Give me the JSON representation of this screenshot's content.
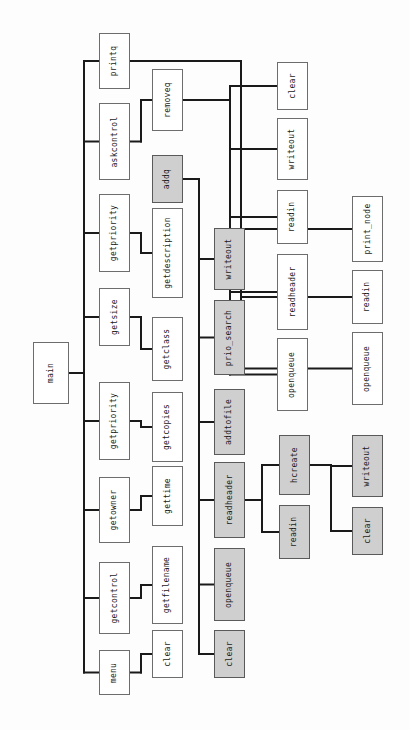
{
  "diagram": {
    "orientation": "rotated-90",
    "colors": {
      "node_fill": "#ffffff",
      "node_fill_highlight": "#cfcfcf",
      "node_border": "#6d6d6d",
      "edge": "#1a1a1a",
      "background": "#fdfdfd"
    },
    "nodes": [
      {
        "id": "main",
        "label": "main",
        "highlight": false,
        "x": 33,
        "y": 342,
        "w": 36,
        "h": 62
      },
      {
        "id": "printq",
        "label": "printq",
        "highlight": false,
        "x": 99,
        "y": 33,
        "w": 31,
        "h": 56
      },
      {
        "id": "askcontrol",
        "label": "askcontrol",
        "highlight": false,
        "x": 99,
        "y": 103,
        "w": 31,
        "h": 77
      },
      {
        "id": "getpriority1",
        "label": "getpriority",
        "highlight": false,
        "x": 99,
        "y": 194,
        "w": 31,
        "h": 78
      },
      {
        "id": "getsize",
        "label": "getsize",
        "highlight": false,
        "x": 99,
        "y": 288,
        "w": 31,
        "h": 58
      },
      {
        "id": "getpriority2",
        "label": "getpriority",
        "highlight": false,
        "x": 99,
        "y": 382,
        "w": 31,
        "h": 78
      },
      {
        "id": "getowner",
        "label": "getowner",
        "highlight": false,
        "x": 99,
        "y": 477,
        "w": 31,
        "h": 66
      },
      {
        "id": "getcontrol",
        "label": "getcontrol",
        "highlight": false,
        "x": 99,
        "y": 562,
        "w": 31,
        "h": 72
      },
      {
        "id": "menu",
        "label": "menu",
        "highlight": false,
        "x": 99,
        "y": 650,
        "w": 31,
        "h": 45
      },
      {
        "id": "removeq",
        "label": "removeq",
        "highlight": false,
        "x": 152,
        "y": 69,
        "w": 31,
        "h": 62
      },
      {
        "id": "addq",
        "label": "addq",
        "highlight": true,
        "x": 152,
        "y": 155,
        "w": 31,
        "h": 48
      },
      {
        "id": "getdescription",
        "label": "getdescription",
        "highlight": false,
        "x": 152,
        "y": 208,
        "w": 31,
        "h": 90
      },
      {
        "id": "getclass",
        "label": "getclass",
        "highlight": false,
        "x": 152,
        "y": 317,
        "w": 31,
        "h": 64
      },
      {
        "id": "getcopies",
        "label": "getcopies",
        "highlight": false,
        "x": 152,
        "y": 392,
        "w": 31,
        "h": 70
      },
      {
        "id": "gettime",
        "label": "gettime",
        "highlight": false,
        "x": 152,
        "y": 466,
        "w": 31,
        "h": 60
      },
      {
        "id": "getfilename",
        "label": "getfilename",
        "highlight": false,
        "x": 152,
        "y": 546,
        "w": 31,
        "h": 78
      },
      {
        "id": "clear_c2",
        "label": "clear",
        "highlight": false,
        "x": 152,
        "y": 630,
        "w": 31,
        "h": 48
      },
      {
        "id": "writeout_a",
        "label": "writeout",
        "highlight": true,
        "x": 214,
        "y": 228,
        "w": 31,
        "h": 62
      },
      {
        "id": "prio_search",
        "label": "prio_search",
        "highlight": true,
        "x": 214,
        "y": 300,
        "w": 31,
        "h": 75
      },
      {
        "id": "addtofile",
        "label": "addtofile",
        "highlight": true,
        "x": 214,
        "y": 389,
        "w": 31,
        "h": 66
      },
      {
        "id": "readheader_a",
        "label": "readheader",
        "highlight": true,
        "x": 214,
        "y": 462,
        "w": 31,
        "h": 76
      },
      {
        "id": "openqueue_a",
        "label": "openqueue",
        "highlight": true,
        "x": 214,
        "y": 548,
        "w": 31,
        "h": 73
      },
      {
        "id": "clear_a",
        "label": "clear",
        "highlight": true,
        "x": 214,
        "y": 630,
        "w": 31,
        "h": 48
      },
      {
        "id": "clear_r",
        "label": "clear",
        "highlight": false,
        "x": 277,
        "y": 62,
        "w": 31,
        "h": 48
      },
      {
        "id": "writeout_r",
        "label": "writeout",
        "highlight": false,
        "x": 277,
        "y": 118,
        "w": 31,
        "h": 62
      },
      {
        "id": "readin_r",
        "label": "readin",
        "highlight": false,
        "x": 277,
        "y": 190,
        "w": 31,
        "h": 54
      },
      {
        "id": "readheader_r",
        "label": "readheader",
        "highlight": false,
        "x": 277,
        "y": 254,
        "w": 31,
        "h": 76
      },
      {
        "id": "openqueue_r",
        "label": "openqueue",
        "highlight": false,
        "x": 277,
        "y": 338,
        "w": 31,
        "h": 73
      },
      {
        "id": "hcreate",
        "label": "hcreate",
        "highlight": true,
        "x": 279,
        "y": 435,
        "w": 31,
        "h": 60
      },
      {
        "id": "readin_h",
        "label": "readin",
        "highlight": true,
        "x": 279,
        "y": 505,
        "w": 31,
        "h": 54
      },
      {
        "id": "print_node",
        "label": "print_node",
        "highlight": false,
        "x": 352,
        "y": 196,
        "w": 31,
        "h": 66
      },
      {
        "id": "readin_p",
        "label": "readin",
        "highlight": false,
        "x": 352,
        "y": 270,
        "w": 31,
        "h": 54
      },
      {
        "id": "openqueue_p",
        "label": "openqueue",
        "highlight": false,
        "x": 352,
        "y": 332,
        "w": 31,
        "h": 73
      },
      {
        "id": "writeout_hc",
        "label": "writeout",
        "highlight": true,
        "x": 352,
        "y": 435,
        "w": 31,
        "h": 62
      },
      {
        "id": "clear_hc",
        "label": "clear",
        "highlight": true,
        "x": 352,
        "y": 507,
        "w": 31,
        "h": 48
      }
    ],
    "edges": [
      {
        "from": "main",
        "to": "printq"
      },
      {
        "from": "main",
        "to": "askcontrol"
      },
      {
        "from": "main",
        "to": "getpriority1"
      },
      {
        "from": "main",
        "to": "getsize"
      },
      {
        "from": "main",
        "to": "getpriority2"
      },
      {
        "from": "main",
        "to": "getowner"
      },
      {
        "from": "main",
        "to": "getcontrol"
      },
      {
        "from": "main",
        "to": "menu"
      },
      {
        "from": "askcontrol",
        "to": "removeq"
      },
      {
        "from": "getpriority1",
        "to": "getdescription"
      },
      {
        "from": "getsize",
        "to": "getclass"
      },
      {
        "from": "getpriority2",
        "to": "getcopies"
      },
      {
        "from": "getowner",
        "to": "gettime"
      },
      {
        "from": "getcontrol",
        "to": "getfilename"
      },
      {
        "from": "menu",
        "to": "clear_c2"
      },
      {
        "from": "addq",
        "to": "writeout_a"
      },
      {
        "from": "addq",
        "to": "prio_search"
      },
      {
        "from": "addq",
        "to": "addtofile"
      },
      {
        "from": "addq",
        "to": "readheader_a"
      },
      {
        "from": "addq",
        "to": "openqueue_a"
      },
      {
        "from": "addq",
        "to": "clear_a"
      },
      {
        "from": "removeq",
        "to": "clear_r"
      },
      {
        "from": "removeq",
        "to": "writeout_r"
      },
      {
        "from": "removeq",
        "to": "readin_r"
      },
      {
        "from": "removeq",
        "to": "readheader_r"
      },
      {
        "from": "removeq",
        "to": "openqueue_r"
      },
      {
        "from": "printq",
        "to": "print_node"
      },
      {
        "from": "printq",
        "to": "readin_p"
      },
      {
        "from": "printq",
        "to": "openqueue_p"
      },
      {
        "from": "readheader_a",
        "to": "hcreate"
      },
      {
        "from": "readheader_a",
        "to": "readin_h"
      },
      {
        "from": "hcreate",
        "to": "writeout_hc"
      },
      {
        "from": "hcreate",
        "to": "clear_hc"
      }
    ]
  }
}
